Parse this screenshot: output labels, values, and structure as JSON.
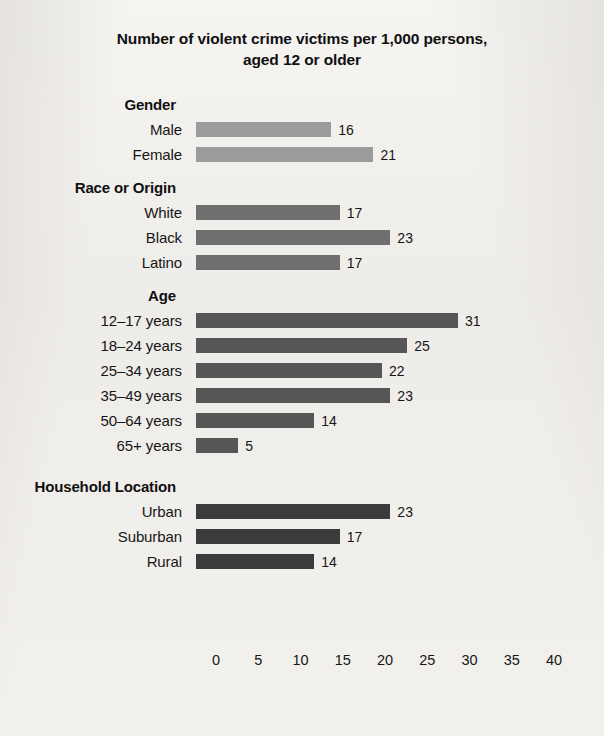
{
  "chart_data": {
    "type": "bar",
    "orientation": "horizontal",
    "title": "Number of violent crime victims per 1,000 persons, aged 12 or older",
    "title_lines": [
      "Number of violent crime victims per 1,000 persons,",
      "aged 12 or older"
    ],
    "xlabel": "",
    "ylabel": "",
    "xlim": [
      0,
      40
    ],
    "xticks": [
      0,
      5,
      10,
      15,
      20,
      25,
      30,
      35,
      40
    ],
    "xtick_labels": [
      "0",
      "5",
      "10",
      "15",
      "20",
      "25",
      "30",
      "35",
      "40"
    ],
    "grid": false,
    "legend": "none",
    "categories": [
      "Male",
      "Female",
      "White",
      "Black",
      "Latino",
      "12–17 years",
      "18–24 years",
      "25–34 years",
      "35–49 years",
      "50–64 years",
      "65+ years",
      "Urban",
      "Suburban",
      "Rural"
    ],
    "values": [
      16,
      21,
      17,
      23,
      17,
      31,
      25,
      22,
      23,
      14,
      5,
      23,
      17,
      14
    ],
    "groups": [
      {
        "heading": "Gender",
        "bar_color": "#9b9b9b",
        "rows": [
          {
            "label": "Male",
            "value": 16,
            "value_label": "16"
          },
          {
            "label": "Female",
            "value": 21,
            "value_label": "21"
          }
        ]
      },
      {
        "heading": "Race or Origin",
        "bar_color": "#6f6f6f",
        "rows": [
          {
            "label": "White",
            "value": 17,
            "value_label": "17"
          },
          {
            "label": "Black",
            "value": 23,
            "value_label": "23"
          },
          {
            "label": "Latino",
            "value": 17,
            "value_label": "17"
          }
        ]
      },
      {
        "heading": "Age",
        "bar_color": "#565656",
        "rows": [
          {
            "label": "12–17 years",
            "value": 31,
            "value_label": "31"
          },
          {
            "label": "18–24 years",
            "value": 25,
            "value_label": "25"
          },
          {
            "label": "25–34 years",
            "value": 22,
            "value_label": "22"
          },
          {
            "label": "35–49 years",
            "value": 23,
            "value_label": "23"
          },
          {
            "label": "50–64 years",
            "value": 14,
            "value_label": "14"
          },
          {
            "label": "65+ years",
            "value": 5,
            "value_label": "5"
          }
        ]
      },
      {
        "heading": "Household Location",
        "bar_color": "#3b3b3b",
        "rows": [
          {
            "label": "Urban",
            "value": 23,
            "value_label": "23"
          },
          {
            "label": "Suburban",
            "value": 17,
            "value_label": "17"
          },
          {
            "label": "Rural",
            "value": 14,
            "value_label": "14"
          }
        ]
      }
    ]
  },
  "colors": {
    "background": "#efedea",
    "text": "#161616",
    "gender_bar": "#9b9b9b",
    "race_bar": "#6f6f6f",
    "age_bar": "#565656",
    "household_bar": "#3b3b3b"
  }
}
